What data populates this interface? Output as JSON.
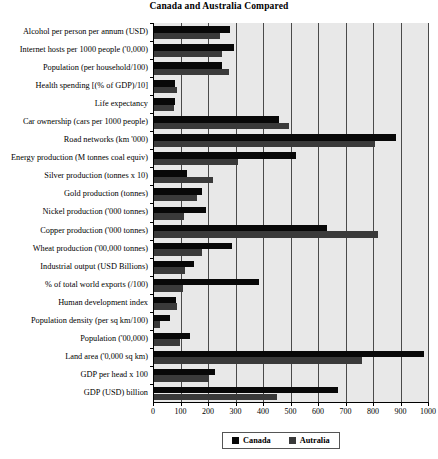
{
  "chart_data": {
    "type": "bar",
    "orientation": "horizontal",
    "title": "Canada and Australia Compared",
    "xlabel": "",
    "ylabel": "",
    "xlim": [
      0,
      1000
    ],
    "xticks": [
      0,
      100,
      200,
      300,
      400,
      500,
      600,
      700,
      800,
      900,
      1000
    ],
    "grid": true,
    "legend_position": "bottom",
    "colors": {
      "canada": "#080808",
      "australia": "#3a3a3a",
      "plot_background": "#e8e8e8"
    },
    "categories": [
      "Alcohol per person per annum (USD)",
      "Internet hosts per 1000 people ('0,000)",
      "Population (per household/100)",
      "Health spending [(% of GDP)/10]",
      "Life expectancy",
      "Car ownership (cars per 1000 people)",
      "Road networks (km '000)",
      "Energy production (M tonnes coal equiv)",
      "Silver production (tonnes x 10)",
      "Gold production (tonnes)",
      "Nickel production ('000 tonnes)",
      "Copper production ('000 tonnes)",
      "Wheat production ('00,000 tonnes)",
      "Industrial output (USD Billions)",
      "% of total world exports (/100)",
      "Human development index",
      "Population density (per sq km/100)",
      "Population ('00,000)",
      "Land area ('0,000 sq km)",
      "GDP per head x 100",
      "GDP (USD) billion"
    ],
    "series": [
      {
        "name": "Canada",
        "color": "#080808",
        "values": [
          276,
          291,
          248,
          77,
          78,
          455,
          880,
          515,
          120,
          175,
          190,
          630,
          285,
          145,
          380,
          80,
          58,
          130,
          980,
          220,
          670
        ]
      },
      {
        "name": "Autralia",
        "color": "#3a3a3a",
        "values": [
          240,
          247,
          272,
          82,
          74,
          490,
          805,
          305,
          215,
          155,
          108,
          815,
          175,
          112,
          105,
          82,
          20,
          95,
          755,
          200,
          447
        ]
      }
    ]
  },
  "legend": {
    "entries": [
      {
        "label": "Canada",
        "swatch": "canada"
      },
      {
        "label": "Autralia",
        "swatch": "australia"
      }
    ]
  }
}
